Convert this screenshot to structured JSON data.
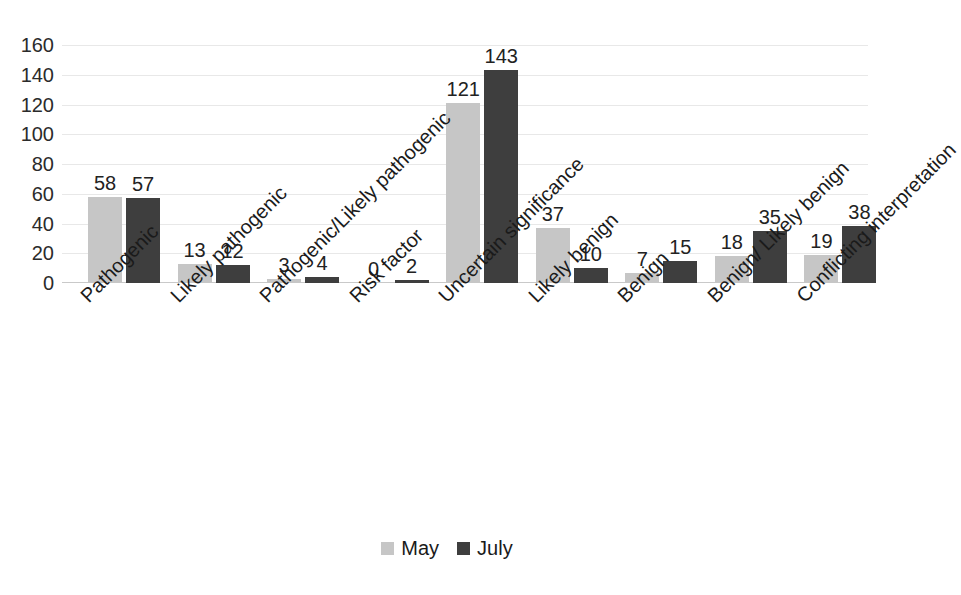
{
  "chart_data": {
    "type": "bar",
    "title": "",
    "subtitle": "",
    "xlabel": "",
    "ylabel": "",
    "ylim": [
      0,
      160
    ],
    "ytick_step": 20,
    "yticks": [
      160,
      140,
      120,
      100,
      80,
      60,
      40,
      20,
      0
    ],
    "grid": true,
    "grid_axis": "y",
    "legend_position": "bottom-center",
    "categories": [
      "Pathogenic",
      "Likely pathogenic",
      "Pathogenic/Likely pathogenic",
      "Risk factor",
      "Uncertain significance",
      "Likely benign",
      "Benign",
      "Benign/ Likely benign",
      "Conflicting interpretation"
    ],
    "series": [
      {
        "name": "May",
        "color": "#c6c6c6",
        "values": [
          58,
          13,
          3,
          0,
          121,
          37,
          7,
          18,
          19
        ]
      },
      {
        "name": "July",
        "color": "#3e3e3e",
        "values": [
          57,
          12,
          4,
          2,
          143,
          10,
          15,
          35,
          38
        ]
      }
    ],
    "data_labels_shown": true
  },
  "legend": {
    "items": [
      {
        "label": "May",
        "color": "#c6c6c6"
      },
      {
        "label": "July",
        "color": "#3e3e3e"
      }
    ]
  }
}
